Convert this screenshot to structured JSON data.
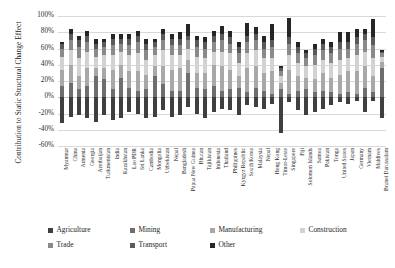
{
  "chart_data": {
    "type": "bar",
    "title": "",
    "subtitle": "",
    "xlabel": "",
    "ylabel": "Contribution to Static Structural Change Effect",
    "stacked": true,
    "grid": true,
    "legend_position": "bottom",
    "ylim": [
      -60,
      100
    ],
    "ytick_labels": [
      "100%",
      "80%",
      "60%",
      "40%",
      "20%",
      "0%",
      "-20%",
      "-40%",
      "-60%"
    ],
    "ytick_values": [
      100,
      80,
      60,
      40,
      20,
      0,
      -20,
      -40,
      -60
    ],
    "colors": {
      "Agriculture": "#3f3f3f",
      "Mining": "#6e6e6e",
      "Manufacturing": "#a8a8a8",
      "Construction": "#d2d2d2",
      "Trade": "#8a8a8a",
      "Transport": "#5a5a5a",
      "Other": "#262626"
    },
    "categories": [
      "Myanmar",
      "China",
      "Armenia",
      "Georgia",
      "Azerbaijan",
      "Turkmenistan",
      "India",
      "Kazakhstan",
      "Lao PDR",
      "Sri Lanka",
      "Cambodia",
      "Mongolia",
      "Uzbekistan",
      "Nepal",
      "Bangladesh",
      "Papua New Guinea",
      "Bhutan",
      "Tajikistan",
      "Indonesia",
      "Thailand",
      "Philippines",
      "Kyrgyz Republic",
      "South Korea",
      "Malaysia",
      "Nepal",
      "Hong Kong",
      "Timor-Leste",
      "Singapore",
      "Fiji",
      "Solomon Islands",
      "Samoa",
      "Pakistan",
      "Tonga",
      "United States",
      "Japan",
      "Germany",
      "Vietnam",
      "Maldives",
      "Brunei Darussalam"
    ],
    "series": [
      {
        "name": "Agriculture",
        "values": [
          -32,
          -24,
          -22,
          -26,
          -30,
          -22,
          -28,
          -26,
          -18,
          -20,
          -26,
          -24,
          -16,
          -24,
          -22,
          -12,
          -20,
          -26,
          -18,
          -14,
          -16,
          -22,
          -10,
          -12,
          -14,
          -8,
          -44,
          -6,
          -16,
          -22,
          -18,
          -14,
          -10,
          -6,
          -8,
          -5,
          -18,
          -4,
          -26
        ]
      },
      {
        "name": "Mining",
        "values": [
          14,
          18,
          10,
          14,
          26,
          22,
          10,
          24,
          12,
          8,
          10,
          26,
          16,
          8,
          8,
          30,
          12,
          10,
          14,
          8,
          10,
          12,
          6,
          12,
          8,
          4,
          10,
          4,
          8,
          10,
          6,
          8,
          6,
          4,
          6,
          4,
          12,
          6,
          36
        ]
      },
      {
        "name": "Manufacturing",
        "values": [
          20,
          22,
          16,
          22,
          10,
          14,
          24,
          16,
          20,
          24,
          18,
          12,
          22,
          26,
          28,
          16,
          18,
          20,
          26,
          30,
          24,
          14,
          30,
          26,
          22,
          28,
          8,
          30,
          18,
          14,
          16,
          22,
          18,
          24,
          26,
          28,
          26,
          20,
          8
        ]
      },
      {
        "name": "Construction",
        "values": [
          16,
          18,
          22,
          20,
          14,
          16,
          18,
          16,
          20,
          22,
          18,
          14,
          20,
          18,
          16,
          14,
          20,
          18,
          16,
          18,
          20,
          16,
          18,
          20,
          18,
          16,
          8,
          18,
          16,
          14,
          18,
          16,
          18,
          18,
          16,
          20,
          18,
          22,
          6
        ]
      },
      {
        "name": "Trade",
        "values": [
          10,
          12,
          14,
          12,
          10,
          10,
          12,
          10,
          12,
          14,
          12,
          10,
          12,
          12,
          12,
          10,
          12,
          12,
          12,
          14,
          12,
          12,
          14,
          12,
          12,
          14,
          6,
          14,
          12,
          10,
          12,
          12,
          12,
          14,
          12,
          14,
          14,
          16,
          4
        ]
      },
      {
        "name": "Transport",
        "values": [
          6,
          8,
          8,
          8,
          6,
          6,
          8,
          6,
          8,
          8,
          8,
          6,
          8,
          8,
          8,
          6,
          8,
          8,
          8,
          8,
          8,
          8,
          8,
          8,
          8,
          8,
          4,
          8,
          8,
          6,
          8,
          8,
          8,
          8,
          8,
          8,
          8,
          10,
          2
        ]
      },
      {
        "name": "Other",
        "values": [
          2,
          6,
          6,
          6,
          6,
          4,
          6,
          6,
          6,
          6,
          6,
          4,
          6,
          6,
          8,
          14,
          6,
          6,
          6,
          10,
          8,
          6,
          16,
          8,
          8,
          20,
          2,
          24,
          6,
          4,
          6,
          6,
          6,
          12,
          12,
          10,
          6,
          22,
          2
        ]
      }
    ]
  },
  "legend": {
    "row1": [
      {
        "label": "Agriculture",
        "color": "#3f3f3f"
      },
      {
        "label": "Mining",
        "color": "#6e6e6e"
      },
      {
        "label": "Manufacturing",
        "color": "#a8a8a8"
      },
      {
        "label": "Construction",
        "color": "#d2d2d2"
      }
    ],
    "row2": [
      {
        "label": "Trade",
        "color": "#8a8a8a"
      },
      {
        "label": "Transport",
        "color": "#5a5a5a"
      },
      {
        "label": "Other",
        "color": "#262626"
      }
    ]
  }
}
